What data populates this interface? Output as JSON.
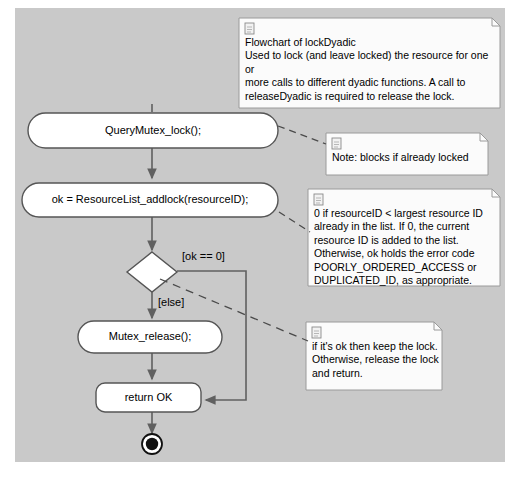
{
  "diagram": {
    "type": "uml-activity-diagram",
    "canvas_color": "#c9c9c9",
    "page_color": "#ffffff",
    "node_fill": "#ffffff",
    "stroke_color": "#555555",
    "note_fill": "#fbfbfb"
  },
  "activities": [
    {
      "id": "query-mutex-lock",
      "label": "QueryMutex_lock();"
    },
    {
      "id": "resourcelist-addlock",
      "label": "ok = ResourceList_addlock(resourceID);"
    },
    {
      "id": "mutex-release",
      "label": "Mutex_release();"
    },
    {
      "id": "return-ok",
      "label": "return OK"
    }
  ],
  "decision": {
    "id": "ok-decision",
    "guard_true": "[ok == 0]",
    "guard_else": "[else]"
  },
  "final_node": {
    "id": "activity-final",
    "label": "activity-final-node"
  },
  "notes": [
    {
      "id": "note-flowchart",
      "icon": "document-icon",
      "text": "Flowchart of lockDyadic\nUsed to lock (and leave locked) the resource for one or\nmore calls to different dyadic functions. A call to\nreleaseDyadic is required to release the lock."
    },
    {
      "id": "note-blocks",
      "icon": "document-icon",
      "text": "Note: blocks if already locked"
    },
    {
      "id": "note-resourceid",
      "icon": "document-icon",
      "text": "0 if resourceID < largest resource ID\nalready in the list. If 0, the current\nresource ID is added to the list.\nOtherwise, ok holds the error code\nPOORLY_ORDERED_ACCESS or\nDUPLICATED_ID, as appropriate."
    },
    {
      "id": "note-keeplock",
      "icon": "document-icon",
      "text": "if it's ok  then keep the lock.\nOtherwise, release the lock\nand return."
    }
  ]
}
